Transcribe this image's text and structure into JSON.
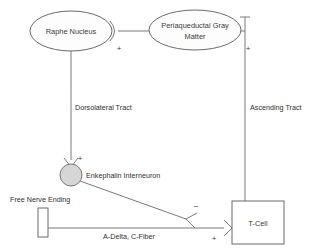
{
  "diagram": {
    "background_color": "#ffffff",
    "stroke_color": "#7a7a7a",
    "text_color": "#2f2f2f",
    "fill_light": "#fdfdfd",
    "fill_gray": "#d6d6d6",
    "nodes": [
      {
        "id": "raphe-nucleus",
        "label": "Raphe Nucleus",
        "shape": "ellipse",
        "cx": 71,
        "cy": 31,
        "rx": 41,
        "ry": 20
      },
      {
        "id": "periaqueductal-gray-matter",
        "label_line1": "Periaqueductal Gray",
        "label_line2": "Matter",
        "shape": "ellipse",
        "cx": 195,
        "cy": 30,
        "rx": 46,
        "ry": 20
      },
      {
        "id": "enkephalin-interneuron",
        "label": "Enkephalin Interneuron",
        "shape": "circle",
        "cx": 71,
        "cy": 175,
        "r": 11
      },
      {
        "id": "free-nerve-ending",
        "label": "Free Nerve Ending",
        "shape": "rectangle",
        "x": 38,
        "y": 208,
        "width": 10,
        "height": 29
      },
      {
        "id": "t-cell",
        "label": "T-Cell",
        "shape": "rectangle",
        "x": 232,
        "y": 201,
        "width": 52,
        "height": 43
      }
    ],
    "edges": [
      {
        "id": "pag-to-raphe",
        "label": "",
        "from": "periaqueductal-gray-matter",
        "to": "raphe-nucleus",
        "sign": "+",
        "sign_x": 119,
        "sign_y": 48
      },
      {
        "id": "raphe-to-interneuron",
        "label": "Dorsolateral Tract",
        "label_x": 75,
        "label_y": 110,
        "from": "raphe-nucleus",
        "to": "enkephalin-interneuron",
        "sign": "+",
        "sign_x": 80,
        "sign_y": 161
      },
      {
        "id": "tcell-to-pag",
        "label": "Ascending Tract",
        "label_x": 250,
        "label_y": 110,
        "from": "t-cell",
        "to": "periaqueductal-gray-matter",
        "sign": "+",
        "sign_x": 248,
        "sign_y": 48
      },
      {
        "id": "interneuron-to-tcell",
        "label": "",
        "from": "enkephalin-interneuron",
        "to": "t-cell",
        "sign": "−",
        "sign_x": 196,
        "sign_y": 209
      },
      {
        "id": "nerve-ending-to-tcell",
        "label": "A-Delta, C-Fiber",
        "label_x": 134,
        "label_y": 236,
        "from": "free-nerve-ending",
        "to": "t-cell",
        "sign": "+",
        "sign_x": 214,
        "sign_y": 239
      }
    ]
  }
}
